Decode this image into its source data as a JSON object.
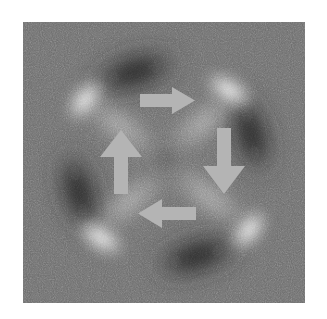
{
  "figure": {
    "kind": "grayscale-micrograph",
    "background_color": "#ffffff",
    "panel": {
      "x": 23,
      "y": 22,
      "width": 282,
      "height": 281,
      "base_gray": "#6e6e6e",
      "bright_color": "#ffffff",
      "dark_color": "#0d0d0d",
      "noise": "fine speckle grain"
    },
    "pattern": {
      "type": "quadrupole-X",
      "lobes": [
        {
          "name": "top-left-bright",
          "cx": 62,
          "cy": 78,
          "rx": 24,
          "ry": 13,
          "rotation_deg": -36,
          "tone": "bright",
          "intensity": 1.0
        },
        {
          "name": "top-left-dark",
          "cx": 108,
          "cy": 52,
          "rx": 46,
          "ry": 17,
          "rotation_deg": -18,
          "tone": "dark",
          "intensity": 1.0
        },
        {
          "name": "top-right-bright",
          "cx": 206,
          "cy": 70,
          "rx": 27,
          "ry": 13,
          "rotation_deg": 34,
          "tone": "bright",
          "intensity": 1.0
        },
        {
          "name": "top-right-dark",
          "cx": 224,
          "cy": 116,
          "rx": 44,
          "ry": 17,
          "rotation_deg": 72,
          "tone": "dark",
          "intensity": 1.0
        },
        {
          "name": "bottom-right-bright",
          "cx": 224,
          "cy": 207,
          "rx": 25,
          "ry": 13,
          "rotation_deg": -36,
          "tone": "bright",
          "intensity": 1.0
        },
        {
          "name": "bottom-right-dark",
          "cx": 178,
          "cy": 232,
          "rx": 46,
          "ry": 17,
          "rotation_deg": -18,
          "tone": "dark",
          "intensity": 1.0
        },
        {
          "name": "bottom-left-bright",
          "cx": 78,
          "cy": 214,
          "rx": 27,
          "ry": 13,
          "rotation_deg": 34,
          "tone": "bright",
          "intensity": 1.0
        },
        {
          "name": "bottom-left-dark",
          "cx": 60,
          "cy": 168,
          "rx": 44,
          "ry": 17,
          "rotation_deg": 72,
          "tone": "dark",
          "intensity": 1.0
        },
        {
          "name": "center-dip",
          "cx": 142,
          "cy": 136,
          "rx": 16,
          "ry": 14,
          "rotation_deg": 0,
          "tone": "dark",
          "intensity": 0.32
        }
      ],
      "arms": [
        {
          "name": "arm-nw",
          "tone": "bright",
          "from": [
            60,
            76
          ],
          "to": [
            136,
            134
          ]
        },
        {
          "name": "arm-ne",
          "tone": "bright",
          "from": [
            208,
            70
          ],
          "to": [
            146,
            132
          ]
        },
        {
          "name": "arm-se",
          "tone": "bright",
          "from": [
            224,
            206
          ],
          "to": [
            148,
            140
          ]
        },
        {
          "name": "arm-sw",
          "tone": "bright",
          "from": [
            78,
            213
          ],
          "to": [
            138,
            144
          ]
        }
      ]
    },
    "arrows": {
      "fill_color": "#b4b4b4",
      "items": [
        {
          "name": "arrow-right",
          "direction": "right",
          "label": "right-arrow",
          "x": 117,
          "y": 65,
          "width": 55,
          "height": 27
        },
        {
          "name": "arrow-down",
          "direction": "down",
          "label": "down-arrow",
          "x": 180,
          "y": 106,
          "width": 42,
          "height": 66
        },
        {
          "name": "arrow-left",
          "direction": "left",
          "label": "left-arrow",
          "x": 115,
          "y": 177,
          "width": 58,
          "height": 29
        },
        {
          "name": "arrow-up",
          "direction": "up",
          "label": "up-arrow",
          "x": 77,
          "y": 108,
          "width": 42,
          "height": 64
        }
      ]
    }
  }
}
